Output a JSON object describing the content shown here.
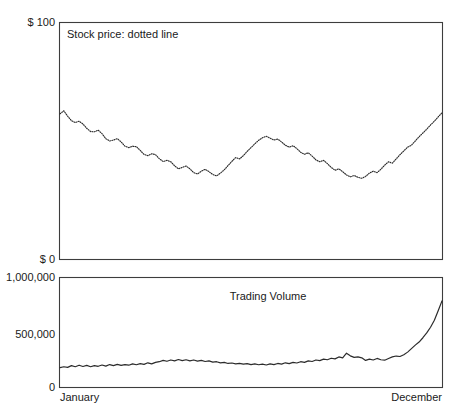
{
  "figure": {
    "width": 458,
    "height": 418,
    "background": "#ffffff",
    "line_color": "#2b2b2b",
    "frame_color": "#3d3d3d"
  },
  "chart_data": [
    {
      "type": "line",
      "name": "stock-price-panel",
      "title": "Stock price: dotted line",
      "annotation": "Stock price: dotted line",
      "xlabel": "",
      "ylabel": "",
      "style": "dotted",
      "grid": false,
      "legend": "inside-top-left",
      "xlim": [
        0,
        100
      ],
      "ylim": [
        0,
        100
      ],
      "ytick_labels": [
        "$ 100",
        "$ 0"
      ],
      "ytick_values": [
        100,
        0
      ],
      "xtick_labels": [
        "January",
        "December"
      ],
      "xtick_values": [
        0,
        100
      ],
      "x": [
        0,
        1,
        2,
        3,
        4,
        5,
        6,
        7,
        8,
        9,
        10,
        11,
        12,
        13,
        14,
        15,
        16,
        17,
        18,
        19,
        20,
        21,
        22,
        23,
        24,
        25,
        26,
        27,
        28,
        29,
        30,
        31,
        32,
        33,
        34,
        35,
        36,
        37,
        38,
        39,
        40,
        41,
        42,
        43,
        44,
        45,
        46,
        47,
        48,
        49,
        50,
        51,
        52,
        53,
        54,
        55,
        56,
        57,
        58,
        59,
        60,
        61,
        62,
        63,
        64,
        65,
        66,
        67,
        68,
        69,
        70,
        71,
        72,
        73,
        74,
        75,
        76,
        77,
        78,
        79,
        80,
        81,
        82,
        83,
        84,
        85,
        86,
        87,
        88,
        89,
        90,
        91,
        92,
        93,
        94,
        95,
        96,
        97,
        98,
        99,
        100
      ],
      "values": [
        61.5,
        62.8,
        60.5,
        58.6,
        57.8,
        58.4,
        57.2,
        55.4,
        54.0,
        53.9,
        54.6,
        53.1,
        51.0,
        50.0,
        50.4,
        51.0,
        49.6,
        47.8,
        47.2,
        47.8,
        47.6,
        46.0,
        44.3,
        43.8,
        44.6,
        44.2,
        42.5,
        41.3,
        41.8,
        41.2,
        39.5,
        38.2,
        38.8,
        39.4,
        38.2,
        36.6,
        36.0,
        37.2,
        38.0,
        37.0,
        35.8,
        35.2,
        36.4,
        37.8,
        39.6,
        41.4,
        43.0,
        42.4,
        43.8,
        45.6,
        47.2,
        48.8,
        50.3,
        51.4,
        52.0,
        51.2,
        50.4,
        50.8,
        49.6,
        48.2,
        47.4,
        48.0,
        46.8,
        45.2,
        44.4,
        45.0,
        43.6,
        42.0,
        41.2,
        41.8,
        40.4,
        38.8,
        37.6,
        38.2,
        37.0,
        35.6,
        34.8,
        35.4,
        34.6,
        34.2,
        35.0,
        36.4,
        37.2,
        36.6,
        38.0,
        39.8,
        41.2,
        40.6,
        42.4,
        44.2,
        45.8,
        47.4,
        48.2,
        50.0,
        51.8,
        53.4,
        55.0,
        56.8,
        58.4,
        60.2,
        62.0,
        64.0,
        65.8
      ],
      "notes": "Stock price declines from ~62 in January to a trough near 35 around April, recovers to a local peak near 52 mid-year, falls again to a low near 34 in September, then rises steadily to ~66 by December."
    },
    {
      "type": "line",
      "name": "trading-volume-panel",
      "title": "Trading Volume",
      "annotation": "Trading Volume",
      "xlabel": "",
      "ylabel": "",
      "style": "solid",
      "grid": false,
      "legend": "inside-top-center",
      "xlim": [
        0,
        100
      ],
      "ylim": [
        0,
        1000000
      ],
      "ytick_labels": [
        "1,000,000",
        "500,000",
        "0"
      ],
      "ytick_values": [
        1000000,
        500000,
        0
      ],
      "xtick_labels": [
        "January",
        "December"
      ],
      "xtick_values": [
        0,
        100
      ],
      "x": [
        0,
        1,
        2,
        3,
        4,
        5,
        6,
        7,
        8,
        9,
        10,
        11,
        12,
        13,
        14,
        15,
        16,
        17,
        18,
        19,
        20,
        21,
        22,
        23,
        24,
        25,
        26,
        27,
        28,
        29,
        30,
        31,
        32,
        33,
        34,
        35,
        36,
        37,
        38,
        39,
        40,
        41,
        42,
        43,
        44,
        45,
        46,
        47,
        48,
        49,
        50,
        51,
        52,
        53,
        54,
        55,
        56,
        57,
        58,
        59,
        60,
        61,
        62,
        63,
        64,
        65,
        66,
        67,
        68,
        69,
        70,
        71,
        72,
        73,
        74,
        75,
        76,
        77,
        78,
        79,
        80,
        81,
        82,
        83,
        84,
        85,
        86,
        87,
        88,
        89,
        90,
        91,
        92,
        93,
        94,
        95,
        96,
        97,
        98,
        99,
        100
      ],
      "values": [
        178000,
        186000,
        180000,
        196000,
        186000,
        200000,
        188000,
        198000,
        186000,
        196000,
        190000,
        202000,
        192000,
        206000,
        196000,
        208000,
        198000,
        206000,
        200000,
        212000,
        204000,
        214000,
        208000,
        222000,
        212000,
        226000,
        232000,
        244000,
        236000,
        248000,
        240000,
        252000,
        242000,
        250000,
        240000,
        248000,
        238000,
        244000,
        234000,
        240000,
        228000,
        232000,
        222000,
        226000,
        216000,
        220000,
        212000,
        216000,
        210000,
        214000,
        206000,
        212000,
        204000,
        210000,
        202000,
        212000,
        206000,
        216000,
        210000,
        222000,
        214000,
        226000,
        220000,
        232000,
        226000,
        240000,
        234000,
        248000,
        242000,
        256000,
        250000,
        264000,
        258000,
        276000,
        268000,
        310000,
        286000,
        272000,
        276000,
        268000,
        244000,
        256000,
        248000,
        262000,
        250000,
        246000,
        262000,
        276000,
        284000,
        280000,
        296000,
        320000,
        352000,
        384000,
        412000,
        452000,
        496000,
        548000,
        612000,
        700000,
        790000,
        880000,
        940000
      ],
      "notes": "Trading volume oscillates around 180,000-250,000 for most of the year, with a spike near 310,000 around week 75, then climbs sharply in the final quarter to roughly 940,000 by December."
    }
  ],
  "labels": {
    "price_top": "$ 100",
    "price_bottom": "$ 0",
    "volume_top": "1,000,000",
    "volume_mid": "500,000",
    "volume_bottom": "0",
    "x_start": "January",
    "x_end": "December",
    "price_annotation": "Stock price: dotted line",
    "volume_annotation": "Trading Volume"
  }
}
